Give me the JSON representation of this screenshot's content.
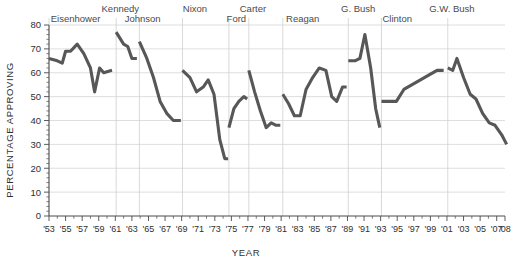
{
  "chart_data": {
    "type": "line",
    "title": "",
    "xlabel": "YEAR",
    "ylabel": "PERCENTAGE APPROVING",
    "ylim": [
      0,
      80
    ],
    "xlim": [
      1953,
      2008
    ],
    "ytick_values": [
      0,
      10,
      20,
      30,
      40,
      50,
      60,
      70,
      80
    ],
    "ytick_labels": [
      "0",
      "10",
      "20",
      "30",
      "40",
      "50",
      "60",
      "70",
      "80"
    ],
    "xtick_labels": [
      "'53",
      "'55",
      "'57",
      "'59",
      "'61",
      "'63",
      "'65",
      "'67",
      "'69",
      "'71",
      "'73",
      "'75",
      "'77",
      "'79",
      "'81",
      "'83",
      "'85",
      "'87",
      "'89",
      "'91",
      "'93",
      "'95",
      "'97",
      "'99",
      "'01",
      "'03",
      "'05",
      "'07",
      "'08"
    ],
    "xtick_values": [
      1953,
      1955,
      1957,
      1959,
      1961,
      1963,
      1965,
      1967,
      1969,
      1971,
      1973,
      1975,
      1977,
      1979,
      1981,
      1983,
      1985,
      1987,
      1989,
      1991,
      1993,
      1995,
      1997,
      1999,
      2001,
      2003,
      2005,
      2007,
      2008
    ],
    "grid": "horizontal-and-vertical",
    "legend": "none",
    "line_color": "#575757",
    "grid_color": "#d6d6d6",
    "series": [
      {
        "name": "Eisenhower",
        "label_x": 1956.2,
        "label_row": 1,
        "points": [
          [
            1953.0,
            66
          ],
          [
            1954.0,
            65
          ],
          [
            1954.6,
            64
          ],
          [
            1955.0,
            69
          ],
          [
            1955.6,
            69
          ],
          [
            1956.4,
            72
          ],
          [
            1957.2,
            68
          ],
          [
            1958.0,
            62
          ],
          [
            1958.5,
            52
          ],
          [
            1959.1,
            62
          ],
          [
            1959.6,
            60
          ],
          [
            1960.6,
            61
          ]
        ]
      },
      {
        "name": "Kennedy",
        "label_x": 1961.6,
        "label_row": 0,
        "points": [
          [
            1961.1,
            77
          ],
          [
            1962.0,
            72
          ],
          [
            1962.5,
            71
          ],
          [
            1963.0,
            66
          ],
          [
            1963.6,
            66
          ]
        ]
      },
      {
        "name": "Johnson",
        "label_x": 1964.3,
        "label_row": 1,
        "points": [
          [
            1963.9,
            73
          ],
          [
            1964.8,
            66
          ],
          [
            1965.6,
            58
          ],
          [
            1966.4,
            48
          ],
          [
            1967.2,
            43
          ],
          [
            1968.0,
            40
          ],
          [
            1968.9,
            40
          ]
        ]
      },
      {
        "name": "Nixon",
        "label_x": 1970.6,
        "label_row": 0,
        "points": [
          [
            1969.1,
            61
          ],
          [
            1970.0,
            58
          ],
          [
            1970.8,
            52
          ],
          [
            1971.6,
            54
          ],
          [
            1972.2,
            57
          ],
          [
            1972.9,
            51
          ],
          [
            1973.6,
            32
          ],
          [
            1974.2,
            24
          ],
          [
            1974.6,
            24
          ]
        ]
      },
      {
        "name": "Ford",
        "label_x": 1975.6,
        "label_row": 1,
        "points": [
          [
            1974.7,
            37
          ],
          [
            1975.3,
            45
          ],
          [
            1975.9,
            48
          ],
          [
            1976.5,
            50
          ],
          [
            1976.9,
            49
          ]
        ]
      },
      {
        "name": "Carter",
        "label_x": 1977.6,
        "label_row": 0,
        "points": [
          [
            1977.1,
            61
          ],
          [
            1977.8,
            52
          ],
          [
            1978.5,
            44
          ],
          [
            1979.2,
            37
          ],
          [
            1979.8,
            39
          ],
          [
            1980.4,
            38
          ],
          [
            1980.9,
            38
          ]
        ]
      },
      {
        "name": "Reagan",
        "label_x": 1983.6,
        "label_row": 1,
        "points": [
          [
            1981.2,
            51
          ],
          [
            1981.9,
            47
          ],
          [
            1982.6,
            42
          ],
          [
            1983.3,
            42
          ],
          [
            1984.0,
            53
          ],
          [
            1984.8,
            58
          ],
          [
            1985.6,
            62
          ],
          [
            1986.4,
            61
          ],
          [
            1987.1,
            50
          ],
          [
            1987.7,
            48
          ],
          [
            1988.4,
            54
          ],
          [
            1988.9,
            54
          ]
        ]
      },
      {
        "name": "G. Bush",
        "label_x": 1990.3,
        "label_row": 0,
        "points": [
          [
            1989.1,
            65
          ],
          [
            1989.9,
            65
          ],
          [
            1990.5,
            66
          ],
          [
            1991.1,
            76
          ],
          [
            1991.8,
            62
          ],
          [
            1992.4,
            45
          ],
          [
            1992.9,
            37
          ]
        ]
      },
      {
        "name": "Clinton",
        "label_x": 1995.0,
        "label_row": 1,
        "points": [
          [
            1993.1,
            48
          ],
          [
            1994.0,
            48
          ],
          [
            1994.9,
            48
          ],
          [
            1995.8,
            53
          ],
          [
            1996.8,
            55
          ],
          [
            1997.8,
            57
          ],
          [
            1998.8,
            59
          ],
          [
            1999.8,
            61
          ],
          [
            2000.6,
            61
          ]
        ]
      },
      {
        "name": "G.W. Bush",
        "label_x": 2001.6,
        "label_row": 0,
        "points": [
          [
            2001.1,
            62
          ],
          [
            2001.7,
            61
          ],
          [
            2002.2,
            66
          ],
          [
            2003.0,
            58
          ],
          [
            2003.8,
            51
          ],
          [
            2004.5,
            49
          ],
          [
            2005.3,
            43
          ],
          [
            2006.1,
            39
          ],
          [
            2006.8,
            38
          ],
          [
            2007.6,
            34
          ],
          [
            2008.2,
            30
          ]
        ]
      }
    ]
  }
}
